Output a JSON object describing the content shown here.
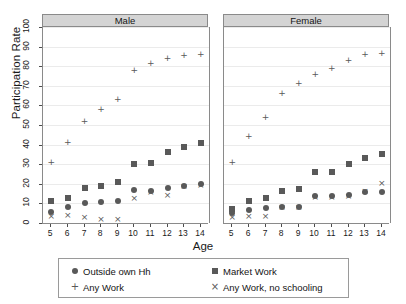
{
  "chart_data": {
    "type": "scatter",
    "title": "",
    "xlabel": "Age",
    "ylabel": "Participation Rate",
    "xlim": [
      4.5,
      14.5
    ],
    "ylim": [
      0,
      100
    ],
    "ytick_labels": [
      "0",
      "10",
      "20",
      "30",
      "40",
      "50",
      "60",
      "70",
      "80",
      "90",
      "100"
    ],
    "ytick_values": [
      0,
      10,
      20,
      30,
      40,
      50,
      60,
      70,
      80,
      90,
      100
    ],
    "grid": true,
    "legend_position": "bottom",
    "categories": [
      5,
      6,
      7,
      8,
      9,
      10,
      11,
      12,
      13,
      14
    ],
    "xtick_labels": [
      "5",
      "6",
      "7",
      "8",
      "9",
      "10",
      "11",
      "12",
      "13",
      "14"
    ],
    "panels": [
      {
        "label": "Male",
        "series": [
          {
            "name": "Outside own Hh",
            "marker": "circle",
            "values": [
              5.5,
              8,
              10,
              10.5,
              11,
              17,
              16.5,
              18,
              19,
              20
            ]
          },
          {
            "name": "Market Work",
            "marker": "square",
            "values": [
              11,
              13,
              18,
              19,
              21,
              30,
              30.5,
              36,
              39,
              41
            ]
          },
          {
            "name": "Any Work",
            "marker": "plus",
            "values": [
              31,
              41,
              52,
              58,
              63,
              78,
              81.5,
              84,
              85.5,
              86
            ]
          },
          {
            "name": "Any Work, no schooling",
            "marker": "ex",
            "values": [
              3.5,
              4,
              3,
              2,
              2,
              12.5,
              15.5,
              14,
              18.5,
              19
            ]
          }
        ]
      },
      {
        "label": "Female",
        "series": [
          {
            "name": "Outside own Hh",
            "marker": "circle",
            "values": [
              5,
              6.5,
              7.5,
              8,
              8,
              14,
              14,
              14.5,
              16,
              16
            ]
          },
          {
            "name": "Market Work",
            "marker": "square",
            "values": [
              7,
              11,
              13,
              16.5,
              17.5,
              26,
              26,
              30,
              33,
              35
            ]
          },
          {
            "name": "Any Work",
            "marker": "plus",
            "values": [
              31,
              44,
              54,
              66,
              71,
              76,
              79,
              83,
              86,
              86.5
            ]
          },
          {
            "name": "Any Work, no schooling",
            "marker": "ex",
            "values": [
              3,
              3.5,
              3.5,
              8,
              8,
              13,
              13,
              13.5,
              16,
              20
            ]
          }
        ]
      }
    ],
    "legend": [
      {
        "label": "Outside own Hh",
        "marker": "circle",
        "glyph": ""
      },
      {
        "label": "Market Work",
        "marker": "square",
        "glyph": ""
      },
      {
        "label": "Any Work",
        "marker": "plus",
        "glyph": "+"
      },
      {
        "label": "Any Work, no schooling",
        "marker": "ex",
        "glyph": "×"
      }
    ],
    "colors": {
      "marker": "#595959",
      "strip": "#d4d4d4",
      "grid": "#ebebeb",
      "axis": "#8a8a8a"
    }
  }
}
